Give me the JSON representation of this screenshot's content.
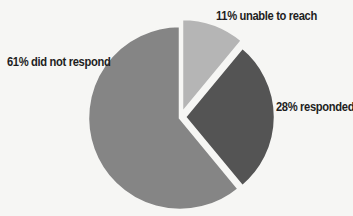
{
  "chart_data": {
    "type": "pie",
    "title": "",
    "categories": [
      "unable to reach",
      "responded",
      "did not respond"
    ],
    "values": [
      11,
      28,
      61
    ],
    "labels": [
      "11% unable to reach",
      "28% responded",
      "61% did not respond"
    ],
    "colors": [
      "#b5b5b5",
      "#545454",
      "#858585"
    ],
    "start_angle_deg": 0,
    "direction": "clockwise",
    "slice_gap_color": "#f6f6f4",
    "legend": "none (direct labels)"
  },
  "labels": {
    "unable_to_reach": "11% unable to reach",
    "responded": "28% responded",
    "did_not_respond": "61% did not respond"
  }
}
